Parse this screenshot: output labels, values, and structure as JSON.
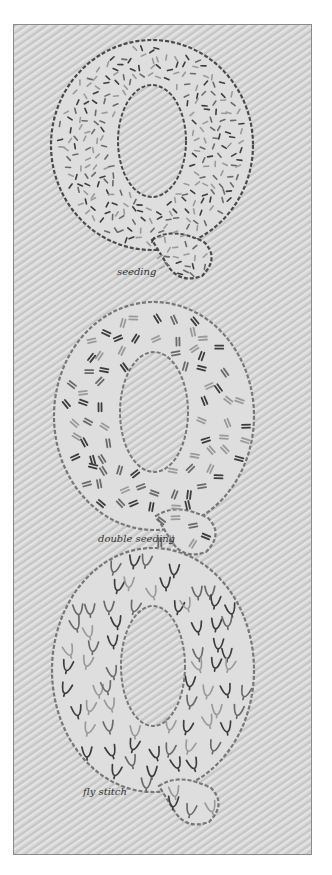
{
  "image": {
    "subject": "embroidered letter Q samples showing filling stitches",
    "palette": {
      "fabric": "#d9d9d9",
      "fabric_weave": "#c4c4c4",
      "fabric_highlight": "#ececec",
      "frame": "#8a8a8a",
      "outline_dark": "#4a4a4a",
      "outline_mid": "#777777",
      "stitch_dark": "#3c3c3c",
      "stitch_mid": "#6a6a6a",
      "stitch_light": "#9a9a9a",
      "caption": "#333333"
    },
    "samples": [
      {
        "letter": "Q",
        "caption": "seeding",
        "stitch": "seeding",
        "outline_tone": "dark"
      },
      {
        "letter": "Q",
        "caption": "double seeding",
        "stitch": "double seeding",
        "outline_tone": "mid"
      },
      {
        "letter": "Q",
        "caption": "fly stitch",
        "stitch": "fly stitch",
        "outline_tone": "light"
      }
    ]
  }
}
